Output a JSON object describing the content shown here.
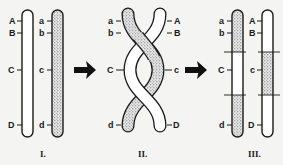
{
  "diagram": {
    "type": "chromosome-crossover",
    "stages": [
      {
        "numeral": "I.",
        "left_labels": [
          "A",
          "B",
          "C",
          "D"
        ],
        "right_labels": [
          "a",
          "b",
          "c",
          "d"
        ]
      },
      {
        "numeral": "II.",
        "left_labels": [
          "a",
          "b",
          "C",
          "d"
        ],
        "right_labels": [
          "A",
          "B",
          "c",
          "D"
        ]
      },
      {
        "numeral": "III.",
        "left_labels": [
          "a",
          "b",
          "C",
          "d"
        ],
        "right_labels": [
          "A",
          "B",
          "c",
          "D"
        ]
      }
    ],
    "arrows": [
      "arrow-1",
      "arrow-2"
    ],
    "colors": {
      "outline": "#1a1a1a",
      "white_chromatid": "#ffffff",
      "dotted_chromatid": "#c8c8c8",
      "background": "#f4f4f2"
    }
  }
}
